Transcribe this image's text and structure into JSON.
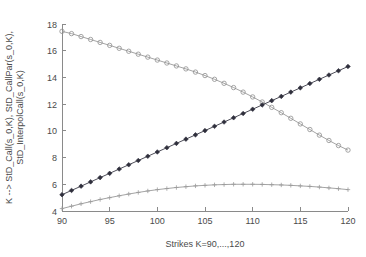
{
  "chart_data": {
    "type": "line",
    "title": "",
    "subtitle": "",
    "xlabel": "Strikes K=90,...,120",
    "ylabel": "K --> StD_Call(s_0,K), StD_CallPar(s_0,K), StD_InterpolCall(s_0,K)",
    "ylabel_line1": "K --> StD_Call(s_0,K), StD_CallPar(s_0,K),",
    "ylabel_line2": "StD_InterpolCall(s_0,K)",
    "xlim": [
      90,
      120
    ],
    "ylim": [
      4,
      18
    ],
    "xticks": [
      90,
      95,
      100,
      105,
      110,
      115,
      120
    ],
    "yticks": [
      4,
      6,
      8,
      10,
      12,
      14,
      16,
      18
    ],
    "xtick_labels": [
      "90",
      "95",
      "100",
      "105",
      "110",
      "115",
      "120"
    ],
    "ytick_labels": [
      "4",
      "6",
      "8",
      "10",
      "12",
      "14",
      "16",
      "18"
    ],
    "grid": false,
    "legend_position": "none",
    "annotations": [],
    "x": [
      90,
      91,
      92,
      93,
      94,
      95,
      96,
      97,
      98,
      99,
      100,
      101,
      102,
      103,
      104,
      105,
      106,
      107,
      108,
      109,
      110,
      111,
      112,
      113,
      114,
      115,
      116,
      117,
      118,
      119,
      120
    ],
    "series": [
      {
        "name": "StD_Call(s_0,K)",
        "marker": "circle",
        "color": "#9a9a9a",
        "values": [
          17.45,
          17.28,
          17.06,
          16.84,
          16.62,
          16.4,
          16.18,
          15.96,
          15.74,
          15.52,
          15.3,
          15.08,
          14.86,
          14.64,
          14.4,
          14.14,
          13.86,
          13.56,
          13.24,
          12.9,
          12.54,
          12.16,
          11.76,
          11.36,
          10.94,
          10.52,
          10.1,
          9.68,
          9.28,
          8.9,
          8.56
        ]
      },
      {
        "name": "StD_CallPar(s_0,K)",
        "marker": "diamond",
        "color": "#2f2f3c",
        "values": [
          5.22,
          5.54,
          5.86,
          6.18,
          6.5,
          6.82,
          7.14,
          7.46,
          7.78,
          8.1,
          8.42,
          8.74,
          9.06,
          9.38,
          9.7,
          10.02,
          10.34,
          10.66,
          10.98,
          11.3,
          11.62,
          11.94,
          12.26,
          12.58,
          12.9,
          13.22,
          13.54,
          13.86,
          14.18,
          14.5,
          14.82
        ]
      },
      {
        "name": "StD_InterpolCall(s_0,K)",
        "marker": "plus",
        "color": "#9a9a9a",
        "values": [
          4.18,
          4.36,
          4.54,
          4.7,
          4.86,
          5.0,
          5.14,
          5.27,
          5.39,
          5.5,
          5.6,
          5.68,
          5.76,
          5.82,
          5.88,
          5.92,
          5.96,
          5.98,
          6.0,
          6.0,
          6.0,
          5.99,
          5.97,
          5.95,
          5.92,
          5.88,
          5.84,
          5.79,
          5.73,
          5.67,
          5.6
        ]
      }
    ],
    "intersection": {
      "x": 109.2,
      "y": 11.9
    }
  },
  "figure": {
    "background_color": "#ffffff",
    "axis_color": "#8a8a8a",
    "text_color": "#4a4a4a"
  }
}
